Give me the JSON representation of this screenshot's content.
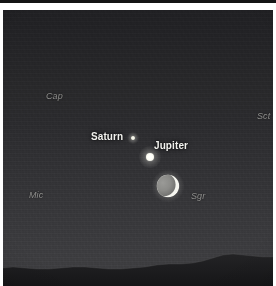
{
  "photo": {
    "alt_description": "Twilight sky photograph showing a conjunction of Jupiter and Saturn with a crescent Moon above a dark hill ridgeline",
    "colors": {
      "sky_top": "#202023",
      "sky_mid": "#2b2b2e",
      "sky_horizon": "#3e3e41",
      "ground": "#1c1c1e",
      "planet_label": "#f2f2ee",
      "constellation_label": "#8e8e8c",
      "star_white": "#ffffff",
      "moon_earthshine": "#8a8a88",
      "moon_crescent": "#f4f4ee",
      "frame_rule": "#141414"
    },
    "objects": [
      {
        "name": "Jupiter",
        "kind": "planet",
        "label": "Jupiter",
        "label_style": "bright",
        "brightness": "brightest",
        "x": 147,
        "y": 147
      },
      {
        "name": "Saturn",
        "kind": "planet",
        "label": "Saturn",
        "label_style": "bright",
        "brightness": "faint",
        "x": 130,
        "y": 128
      },
      {
        "name": "Moon",
        "kind": "moon",
        "label": "",
        "phase": "waxing crescent with earthshine",
        "x": 165,
        "y": 176
      },
      {
        "name": "field star",
        "kind": "star",
        "label": "",
        "brightness": "very faint",
        "x": 195,
        "y": 258
      }
    ],
    "labels": {
      "planets": [
        {
          "id": "saturn",
          "text": "Saturn"
        },
        {
          "id": "jupiter",
          "text": "Jupiter"
        }
      ],
      "constellations": [
        {
          "id": "cap",
          "text": "Cap"
        },
        {
          "id": "mic",
          "text": "Mic"
        },
        {
          "id": "sct",
          "text": "Sct"
        },
        {
          "id": "sgr",
          "text": "Sgr"
        }
      ]
    },
    "foreground": {
      "type": "hill ridgeline silhouette",
      "position": "bottom of frame"
    }
  }
}
